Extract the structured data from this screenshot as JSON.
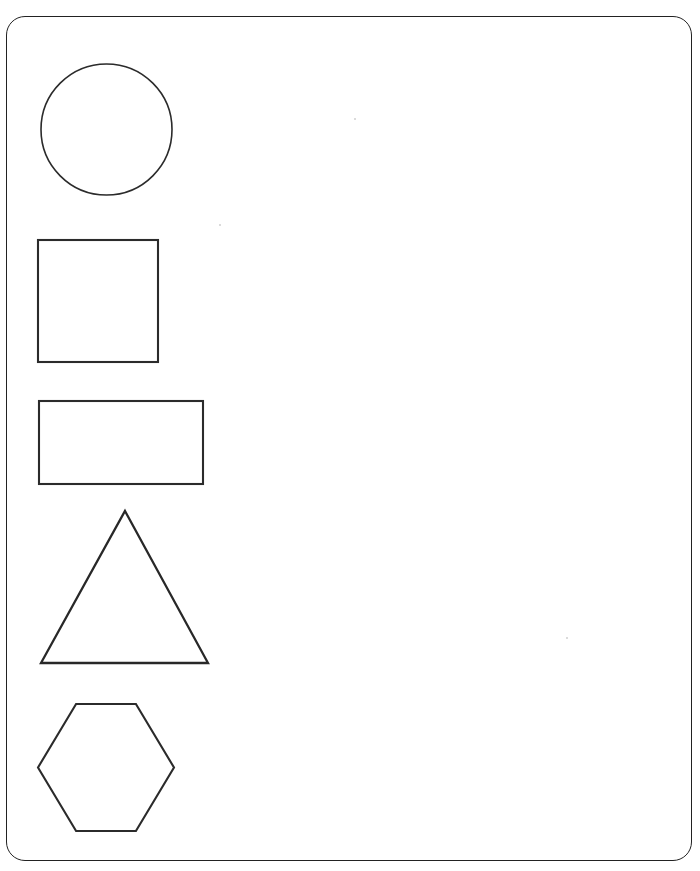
{
  "page": {
    "width": 700,
    "height": 871,
    "background_color": "#ffffff",
    "border": {
      "name": "rounded-page-frame",
      "color": "#222222",
      "stroke_width": 1.6,
      "corner_radius": 19,
      "x": 6,
      "y": 16,
      "width": 686,
      "height": 845
    }
  },
  "shapes": [
    {
      "id": "circle",
      "label": "Circle",
      "sides": 0,
      "stroke_color": "#2b2b2b",
      "stroke_width": 1.6,
      "fill": "none",
      "bounds": {
        "x": 41,
        "y": 64,
        "width": 131,
        "height": 131
      },
      "center": {
        "x": 106,
        "y": 130
      },
      "radius": 65
    },
    {
      "id": "square",
      "label": "Square",
      "sides": 4,
      "stroke_color": "#2b2b2b",
      "stroke_width": 2.1,
      "fill": "none",
      "bounds": {
        "x": 38,
        "y": 240,
        "width": 120,
        "height": 122
      }
    },
    {
      "id": "rectangle",
      "label": "Rectangle",
      "sides": 4,
      "stroke_color": "#2b2b2b",
      "stroke_width": 2.1,
      "fill": "none",
      "bounds": {
        "x": 39,
        "y": 401,
        "width": 164,
        "height": 83
      }
    },
    {
      "id": "triangle",
      "label": "Triangle",
      "sides": 3,
      "stroke_color": "#282828",
      "stroke_width": 2.3,
      "fill": "none",
      "bounds": {
        "x": 41,
        "y": 511,
        "width": 167,
        "height": 152
      },
      "apex": {
        "x": 125,
        "y": 511
      },
      "base_left": {
        "x": 41,
        "y": 663
      },
      "base_right": {
        "x": 208,
        "y": 663
      }
    },
    {
      "id": "hexagon",
      "label": "Hexagon",
      "sides": 6,
      "stroke_color": "#282828",
      "stroke_width": 2.1,
      "fill": "none",
      "bounds": {
        "x": 38,
        "y": 704,
        "width": 136,
        "height": 127
      },
      "orientation": "flat-top"
    }
  ],
  "shape_count": 5,
  "annotations": []
}
